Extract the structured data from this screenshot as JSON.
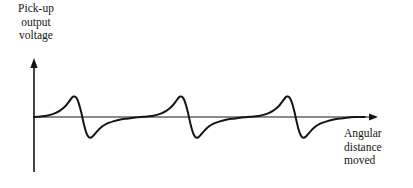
{
  "figure": {
    "background_color": "#ffffff",
    "ink_color": "#141414",
    "width": 413,
    "height": 188
  },
  "labels": {
    "y_axis": "Pick-up\noutput\nvoltage",
    "x_axis": "Angular\ndistance\nmoved"
  },
  "chart_data": {
    "type": "line",
    "title": "",
    "xlabel": "Angular distance moved",
    "ylabel": "Pick-up output voltage",
    "grid": false,
    "legend": null,
    "axes": {
      "x_axis": {
        "label": "Angular distance moved",
        "arrow": "right",
        "ticks": [],
        "tick_labels": [],
        "baseline_y_value": 0,
        "origin_px": 34,
        "end_px": 378,
        "baseline_px": 117
      },
      "y_axis": {
        "label": "Pick-up output voltage",
        "arrow": "up",
        "ticks": [],
        "tick_labels": [],
        "position_px": 34,
        "top_px": 58,
        "bottom_px": 172
      },
      "xlim": [
        0,
        3.15
      ],
      "ylim": [
        -1.15,
        1.0
      ]
    },
    "series": [
      {
        "name": "Pick-up output voltage",
        "color": "#141414",
        "line_width": 2,
        "description": "Three identical asymmetric bipolar pulses: gradual rise to positive peak, steep fall through zero to a negative trough, then asymptotic recovery back to the baseline.",
        "pulse_count": 3,
        "period": 1.0,
        "peak_value": 0.5,
        "trough_value": -0.5,
        "peak_x": [
          0.36,
          1.36,
          2.36
        ],
        "zero_crossing_x": [
          0.45,
          1.45,
          2.45
        ],
        "trough_x": [
          0.53,
          1.53,
          2.53
        ],
        "points": [
          [
            0.0,
            0.0
          ],
          [
            0.04,
            0.006
          ],
          [
            0.08,
            0.016
          ],
          [
            0.12,
            0.032
          ],
          [
            0.16,
            0.058
          ],
          [
            0.2,
            0.095
          ],
          [
            0.24,
            0.148
          ],
          [
            0.27,
            0.205
          ],
          [
            0.3,
            0.28
          ],
          [
            0.33,
            0.38
          ],
          [
            0.355,
            0.47
          ],
          [
            0.37,
            0.5
          ],
          [
            0.385,
            0.496
          ],
          [
            0.4,
            0.455
          ],
          [
            0.415,
            0.37
          ],
          [
            0.43,
            0.245
          ],
          [
            0.445,
            0.09
          ],
          [
            0.455,
            -0.03
          ],
          [
            0.47,
            -0.2
          ],
          [
            0.485,
            -0.34
          ],
          [
            0.5,
            -0.44
          ],
          [
            0.515,
            -0.495
          ],
          [
            0.53,
            -0.505
          ],
          [
            0.545,
            -0.485
          ],
          [
            0.56,
            -0.445
          ],
          [
            0.58,
            -0.385
          ],
          [
            0.6,
            -0.325
          ],
          [
            0.63,
            -0.25
          ],
          [
            0.66,
            -0.195
          ],
          [
            0.7,
            -0.145
          ],
          [
            0.75,
            -0.1
          ],
          [
            0.8,
            -0.068
          ],
          [
            0.85,
            -0.045
          ],
          [
            0.9,
            -0.028
          ],
          [
            0.95,
            -0.014
          ],
          [
            1.0,
            0.0
          ],
          [
            1.04,
            0.006
          ],
          [
            1.08,
            0.016
          ],
          [
            1.12,
            0.032
          ],
          [
            1.16,
            0.058
          ],
          [
            1.2,
            0.095
          ],
          [
            1.24,
            0.148
          ],
          [
            1.27,
            0.205
          ],
          [
            1.3,
            0.28
          ],
          [
            1.33,
            0.38
          ],
          [
            1.355,
            0.47
          ],
          [
            1.37,
            0.5
          ],
          [
            1.385,
            0.496
          ],
          [
            1.4,
            0.455
          ],
          [
            1.415,
            0.37
          ],
          [
            1.43,
            0.245
          ],
          [
            1.445,
            0.09
          ],
          [
            1.455,
            -0.03
          ],
          [
            1.47,
            -0.2
          ],
          [
            1.485,
            -0.34
          ],
          [
            1.5,
            -0.44
          ],
          [
            1.515,
            -0.495
          ],
          [
            1.53,
            -0.505
          ],
          [
            1.545,
            -0.485
          ],
          [
            1.56,
            -0.445
          ],
          [
            1.58,
            -0.385
          ],
          [
            1.6,
            -0.325
          ],
          [
            1.63,
            -0.25
          ],
          [
            1.66,
            -0.195
          ],
          [
            1.7,
            -0.145
          ],
          [
            1.75,
            -0.1
          ],
          [
            1.8,
            -0.068
          ],
          [
            1.85,
            -0.045
          ],
          [
            1.9,
            -0.028
          ],
          [
            1.95,
            -0.014
          ],
          [
            2.0,
            0.0
          ],
          [
            2.04,
            0.006
          ],
          [
            2.08,
            0.016
          ],
          [
            2.12,
            0.032
          ],
          [
            2.16,
            0.058
          ],
          [
            2.2,
            0.095
          ],
          [
            2.24,
            0.148
          ],
          [
            2.27,
            0.205
          ],
          [
            2.3,
            0.28
          ],
          [
            2.33,
            0.38
          ],
          [
            2.355,
            0.47
          ],
          [
            2.37,
            0.5
          ],
          [
            2.385,
            0.496
          ],
          [
            2.4,
            0.455
          ],
          [
            2.415,
            0.37
          ],
          [
            2.43,
            0.245
          ],
          [
            2.445,
            0.09
          ],
          [
            2.455,
            -0.03
          ],
          [
            2.47,
            -0.2
          ],
          [
            2.485,
            -0.34
          ],
          [
            2.5,
            -0.44
          ],
          [
            2.515,
            -0.495
          ],
          [
            2.53,
            -0.505
          ],
          [
            2.545,
            -0.485
          ],
          [
            2.56,
            -0.445
          ],
          [
            2.58,
            -0.385
          ],
          [
            2.6,
            -0.325
          ],
          [
            2.63,
            -0.25
          ],
          [
            2.66,
            -0.195
          ],
          [
            2.7,
            -0.145
          ],
          [
            2.75,
            -0.1
          ],
          [
            2.8,
            -0.068
          ],
          [
            2.85,
            -0.045
          ],
          [
            2.9,
            -0.028
          ],
          [
            2.95,
            -0.014
          ],
          [
            3.0,
            0.0
          ],
          [
            3.05,
            0.0
          ],
          [
            3.1,
            0.0
          ]
        ]
      }
    ]
  }
}
